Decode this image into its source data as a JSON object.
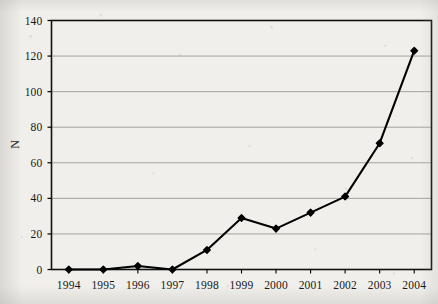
{
  "chart_data": {
    "type": "line",
    "title": "",
    "xlabel": "",
    "ylabel": "N",
    "categories": [
      "1994",
      "1995",
      "1996",
      "1997",
      "1998",
      "1999",
      "2000",
      "2001",
      "2002",
      "2003",
      "2004"
    ],
    "values": [
      0,
      0,
      2,
      0,
      11,
      29,
      23,
      32,
      41,
      71,
      123
    ],
    "series": [
      {
        "name": "N",
        "values": [
          0,
          0,
          2,
          0,
          11,
          29,
          23,
          32,
          41,
          71,
          123
        ]
      }
    ],
    "ylim": [
      0,
      140
    ],
    "yticks": [
      0,
      20,
      40,
      60,
      80,
      100,
      120,
      140
    ],
    "ytick_labels": [
      "0",
      "20",
      "40",
      "60",
      "80",
      "100",
      "120",
      "140"
    ],
    "xtick_labels": [
      "1994",
      "1995",
      "1996",
      "1997",
      "1998",
      "1999",
      "2000",
      "2001",
      "2002",
      "2003",
      "2004"
    ],
    "grid": "horizontal",
    "legend": "none",
    "marker": "filled-diamond",
    "line_color": "#000000",
    "marker_color": "#000000",
    "grid_color": "#9a9a96",
    "axis_color": "#000000",
    "background_color": "#f0efeb"
  }
}
